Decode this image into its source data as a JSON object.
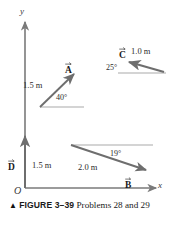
{
  "figure": {
    "axes": {
      "y_label": "y",
      "x_label": "x",
      "origin_label": "O"
    },
    "vectors": [
      {
        "id": "A",
        "label": "A",
        "magnitude_label": "1.5 m",
        "angle_label": "40°",
        "direction": "up-right",
        "tail": [
          40,
          107
        ],
        "head": [
          76,
          72
        ]
      },
      {
        "id": "B",
        "label": "B",
        "magnitude_label": "2.0 m",
        "angle_label": "19°",
        "direction": "down-right",
        "tail": [
          71,
          145
        ],
        "head": [
          149,
          171
        ]
      },
      {
        "id": "C",
        "label": "C",
        "magnitude_label": "1.0 m",
        "angle_label": "25°",
        "direction": "up-left",
        "tail": [
          164,
          72
        ],
        "head": [
          127,
          61
        ]
      },
      {
        "id": "D",
        "label": "D",
        "magnitude_label": "1.5 m",
        "angle_label": "",
        "direction": "up",
        "tail": [
          25,
          188
        ],
        "head": [
          25,
          133
        ]
      }
    ],
    "caption": {
      "marker": "▲",
      "figure_number": "FIGURE 3–39",
      "text": "Problems 28 and 29"
    },
    "colors": {
      "vector": "#6e6e6e",
      "axis": "#7a7a7a",
      "text": "#1a1a1a"
    }
  }
}
